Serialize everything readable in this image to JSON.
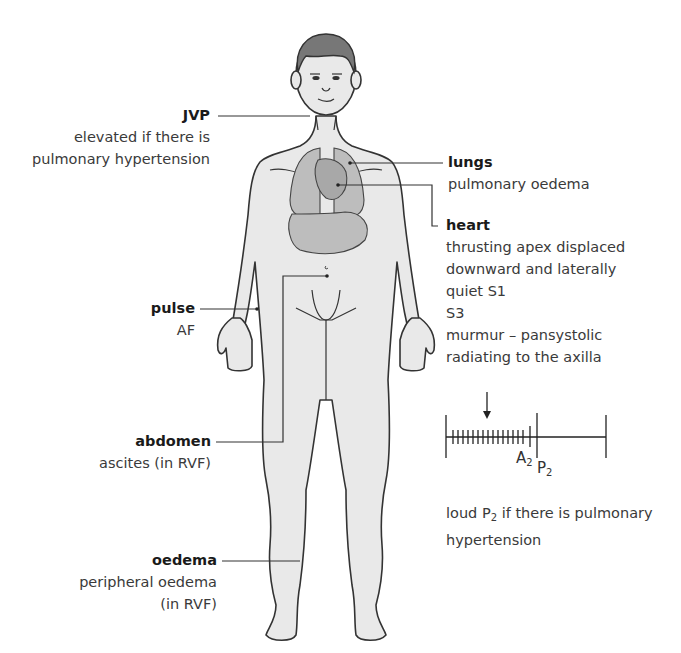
{
  "diagram": {
    "colors": {
      "body_fill": "#e9e9e9",
      "organ_fill": "#bdbdbd",
      "outline": "#333333",
      "text": "#333333"
    },
    "labels": {
      "jvp": {
        "title": "JVP",
        "desc": [
          "elevated if there is",
          "pulmonary hypertension"
        ]
      },
      "pulse": {
        "title": "pulse",
        "desc": [
          "AF"
        ]
      },
      "abdomen": {
        "title": "abdomen",
        "desc": [
          "ascites (in RVF)"
        ]
      },
      "oedema": {
        "title": "oedema",
        "desc": [
          "peripheral oedema",
          "(in RVF)"
        ]
      },
      "lungs": {
        "title": "lungs",
        "desc": [
          "pulmonary oedema"
        ]
      },
      "heart": {
        "title": "heart",
        "desc": [
          "thrusting apex displaced",
          "downward and laterally",
          "quiet S1",
          "S3",
          "murmur – pansystolic",
          "radiating to the axilla"
        ]
      }
    },
    "phonocardiogram": {
      "a2_label": "A",
      "a2_sub": "2",
      "p2_label": "P",
      "p2_sub": "2",
      "murmur_ticks": 15
    },
    "footnote": {
      "prefix": "loud P",
      "sub": "2",
      "suffix": " if there is pulmonary",
      "line2": "hypertension"
    }
  }
}
